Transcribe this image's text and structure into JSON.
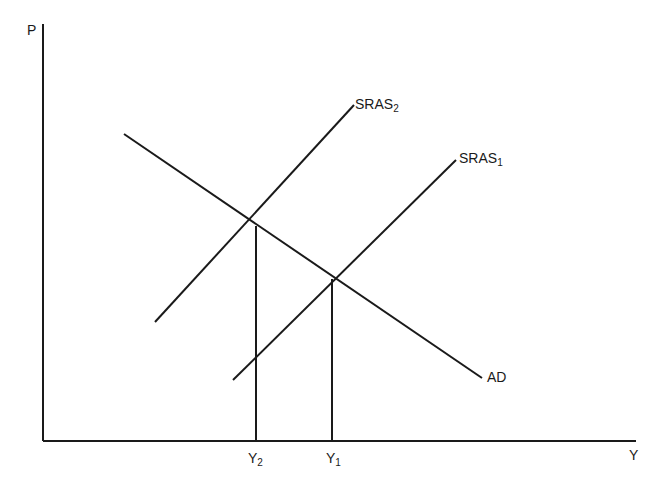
{
  "diagram": {
    "title": "",
    "axes": {
      "y_label": "P",
      "x_label": "Y"
    },
    "curves": [
      {
        "name": "AD",
        "label": "AD",
        "sub": ""
      },
      {
        "name": "SRAS2",
        "label": "SRAS",
        "sub": "2"
      },
      {
        "name": "SRAS1",
        "label": "SRAS",
        "sub": "1"
      }
    ],
    "x_ticks": [
      {
        "label": "Y",
        "sub": "2"
      },
      {
        "label": "Y",
        "sub": "1"
      }
    ],
    "colors": {
      "line": "#1a1a1a",
      "background": "#ffffff"
    }
  }
}
